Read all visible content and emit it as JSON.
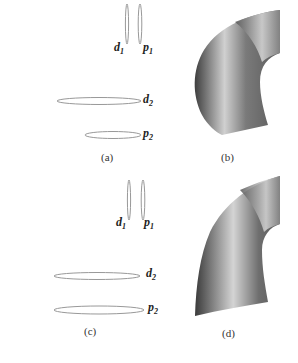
{
  "figure": {
    "panels": [
      {
        "id": "a",
        "caption": "(a)",
        "type": "cross-sections",
        "labels": [
          {
            "base": "d",
            "sub": "1"
          },
          {
            "base": "p",
            "sub": "1"
          },
          {
            "base": "d",
            "sub": "2"
          },
          {
            "base": "p",
            "sub": "2"
          }
        ]
      },
      {
        "id": "b",
        "caption": "(b)",
        "type": "swept-surface"
      },
      {
        "id": "c",
        "caption": "(c)",
        "type": "cross-sections",
        "labels": [
          {
            "base": "d",
            "sub": "1"
          },
          {
            "base": "p",
            "sub": "1"
          },
          {
            "base": "d",
            "sub": "2"
          },
          {
            "base": "p",
            "sub": "2"
          }
        ]
      },
      {
        "id": "d",
        "caption": "(d)",
        "type": "swept-surface"
      }
    ],
    "colors": {
      "curve": "#999999",
      "surface_dark": "#4a4a4a",
      "surface_light": "#d8d8d8"
    }
  }
}
